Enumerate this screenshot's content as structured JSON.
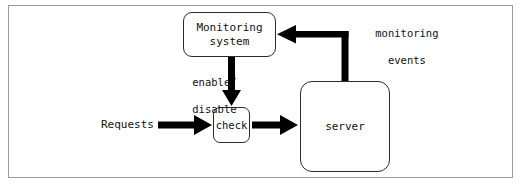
{
  "diagram": {
    "background_color": "#ffffff",
    "frame_border_color": "#9a9a9a",
    "stroke_color": "#000000",
    "node_border_color": "#2b2b2b",
    "text_color": "#111111",
    "nodes": [
      {
        "id": "monitoring",
        "label_line1": "Monitoring",
        "label_line2": "system",
        "shape": "rounded-rect"
      },
      {
        "id": "check",
        "label": "check",
        "shape": "rounded-rect"
      },
      {
        "id": "server",
        "label": "server",
        "shape": "rounded-rect"
      }
    ],
    "edges": [
      {
        "id": "requests-to-check",
        "from": "requests-source",
        "to": "check",
        "label": "Requests",
        "direction": "right"
      },
      {
        "id": "monitoring-to-check",
        "from": "monitoring",
        "to": "check",
        "label_line1": "enable/",
        "label_line2": "disable",
        "direction": "down"
      },
      {
        "id": "check-to-server",
        "from": "check",
        "to": "server",
        "label": "",
        "direction": "right"
      },
      {
        "id": "server-to-monitoring",
        "from": "server",
        "to": "monitoring",
        "label_line1": "monitoring",
        "label_line2": "events",
        "direction": "up-then-left"
      }
    ]
  }
}
